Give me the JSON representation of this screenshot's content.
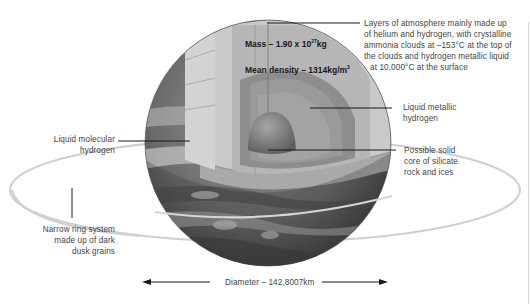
{
  "diagram": {
    "stats": {
      "mass_prefix": "Mass – 1.90 x 10",
      "mass_exp": "27",
      "mass_unit": "kg",
      "density_prefix": "Mean density – 1314kg/m",
      "density_exp": "3"
    },
    "labels": {
      "atmosphere": [
        "Layers of atmosphere mainly made up",
        "of helium and hydrogen, with crystalline",
        "ammonia clouds at –153°C at the top of",
        "the clouds and hydrogen metallic liquid",
        "at 10,000°C at the surface"
      ],
      "liquid_metallic": [
        "Liquid metallic",
        "hydrogen"
      ],
      "core": [
        "Possible solid",
        "core of silicate",
        "rock and ices"
      ],
      "liquid_molecular": [
        "Liquid molecular",
        "hydrogen"
      ],
      "ring": [
        "Narrow ring system",
        "made up of dark",
        "dusk grains"
      ]
    },
    "diameter": "Diameter – 142,8007km",
    "colors": {
      "outer_layer": "#c9c9c9",
      "molecular_layer": "#b4b4b4",
      "metallic_layer": "#8e8e8e",
      "inner_band": "#6f6f6f",
      "core": "#7a7a7a",
      "planet_dark": "#3a3a3a",
      "ring": "#c8c8c8",
      "leader_line": "#1a1a1a"
    }
  }
}
